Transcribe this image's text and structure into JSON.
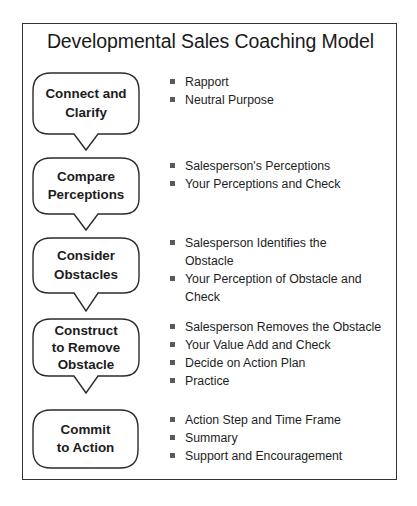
{
  "title": "Developmental Sales Coaching Model",
  "colors": {
    "border": "#333333",
    "bullet": "#5a5a5a",
    "text": "#1a1a1a"
  },
  "steps": [
    {
      "label_lines": [
        "Connect and",
        "Clarify"
      ],
      "bullets": [
        "Rapport",
        "Neutral Purpose"
      ]
    },
    {
      "label_lines": [
        "Compare",
        "Perceptions"
      ],
      "bullets": [
        "Salesperson's Perceptions",
        "Your Perceptions and Check"
      ]
    },
    {
      "label_lines": [
        "Consider",
        "Obstacles"
      ],
      "bullets": [
        "Salesperson Identifies the Obstacle",
        "Your Perception of Obstacle and Check"
      ]
    },
    {
      "label_lines": [
        "Construct",
        "to Remove",
        "Obstacle"
      ],
      "bullets": [
        "Salesperson Removes the Obstacle",
        "Your Value Add and Check",
        "Decide on Action Plan",
        "Practice"
      ]
    },
    {
      "label_lines": [
        "Commit",
        "to Action"
      ],
      "bullets": [
        "Action Step and Time Frame",
        "Summary",
        "Support and Encouragement"
      ]
    }
  ]
}
